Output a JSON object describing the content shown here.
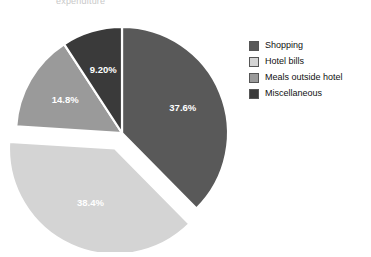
{
  "figure": {
    "top_fragment": "expenditure",
    "background_color": "#ffffff"
  },
  "legend": {
    "position": "right",
    "items": [
      {
        "label": "Shopping",
        "color": "#595959"
      },
      {
        "label": "Hotel bills",
        "color": "#d4d4d4"
      },
      {
        "label": "Meals outside hotel",
        "color": "#9a9a9a"
      },
      {
        "label": "Miscellaneous",
        "color": "#3a3a3a"
      }
    ]
  },
  "chart_data": {
    "type": "pie",
    "title": "",
    "labels": [
      "Shopping",
      "Hotel bills",
      "Meals outside hotel",
      "Miscellaneous"
    ],
    "values": [
      37.6,
      38.4,
      14.8,
      9.2
    ],
    "value_labels": [
      "37.6%",
      "38.4%",
      "14.8%",
      "9.20%"
    ],
    "colors": [
      "#595959",
      "#d4d4d4",
      "#9a9a9a",
      "#3a3a3a"
    ],
    "units": "percent",
    "start_angle_deg": 0,
    "direction": "clockwise",
    "exploded": [
      "Hotel bills"
    ],
    "explode_offset": 0.08,
    "legend_position": "right",
    "grid": false,
    "label_text_colors": [
      "#ffffff",
      "#1a1a1a",
      "#1a1a1a",
      "#ffffff"
    ]
  }
}
